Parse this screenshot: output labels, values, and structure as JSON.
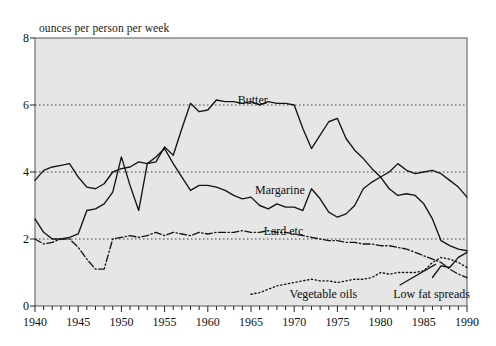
{
  "chart_data": {
    "type": "line",
    "title": "",
    "subtitle": "",
    "ylabel": "ounces per person per week",
    "xlabel": "",
    "xlim": [
      1940,
      1990
    ],
    "ylim": [
      0,
      8
    ],
    "yticks": [
      0,
      2,
      4,
      6,
      8
    ],
    "xticks": [
      1940,
      1945,
      1950,
      1955,
      1960,
      1965,
      1970,
      1975,
      1980,
      1985,
      1990
    ],
    "xtick_minor_step": 1,
    "grid": "horizontal dotted gridlines at 2, 4 and 6",
    "legend": "inline labels placed on the curves",
    "plot_background": "#e6e6e6",
    "line_color": "#141414",
    "x": [
      1940,
      1941,
      1942,
      1943,
      1944,
      1945,
      1946,
      1947,
      1948,
      1949,
      1950,
      1951,
      1952,
      1953,
      1954,
      1955,
      1956,
      1957,
      1958,
      1959,
      1960,
      1961,
      1962,
      1963,
      1964,
      1965,
      1966,
      1967,
      1968,
      1969,
      1970,
      1971,
      1972,
      1973,
      1974,
      1975,
      1976,
      1977,
      1978,
      1979,
      1980,
      1981,
      1982,
      1983,
      1984,
      1985,
      1986,
      1987,
      1988,
      1989,
      1990
    ],
    "series": [
      {
        "name": "Butter",
        "style": "solid",
        "label_x": 1963,
        "label_y": 6.15,
        "values": [
          2.6,
          2.2,
          2.0,
          2.0,
          2.05,
          2.15,
          2.85,
          2.9,
          3.05,
          3.4,
          4.45,
          3.6,
          2.85,
          4.25,
          4.3,
          4.75,
          4.5,
          5.3,
          6.05,
          5.8,
          5.85,
          6.15,
          6.1,
          6.1,
          6.05,
          6.1,
          6.0,
          6.1,
          6.05,
          6.05,
          6.0,
          5.3,
          4.7,
          5.1,
          5.5,
          5.6,
          5.0,
          4.65,
          4.4,
          4.1,
          3.85,
          3.5,
          3.3,
          3.35,
          3.3,
          3.05,
          2.6,
          1.95,
          1.8,
          1.7,
          1.65
        ]
      },
      {
        "name": "Margarine",
        "style": "solid",
        "label_x": 1965,
        "label_y": 3.45,
        "values": [
          3.75,
          4.05,
          4.15,
          4.2,
          4.25,
          3.85,
          3.55,
          3.5,
          3.65,
          4.0,
          4.1,
          4.15,
          4.3,
          4.25,
          4.45,
          4.7,
          4.25,
          3.85,
          3.45,
          3.6,
          3.6,
          3.55,
          3.45,
          3.3,
          3.2,
          3.25,
          3.0,
          2.9,
          3.05,
          2.95,
          2.95,
          2.85,
          3.5,
          3.2,
          2.8,
          2.65,
          2.75,
          3.0,
          3.5,
          3.7,
          3.85,
          4.0,
          4.25,
          4.05,
          3.95,
          4.0,
          4.05,
          3.95,
          3.75,
          3.55,
          3.25
        ]
      },
      {
        "name": "Lard etc",
        "style": "dash-dot",
        "label_x": 1966,
        "label_y": 2.25,
        "values": [
          2.0,
          1.85,
          1.9,
          2.0,
          2.0,
          1.75,
          1.4,
          1.1,
          1.1,
          2.0,
          2.05,
          2.1,
          2.05,
          2.1,
          2.2,
          2.1,
          2.2,
          2.15,
          2.1,
          2.2,
          2.15,
          2.2,
          2.2,
          2.2,
          2.25,
          2.2,
          2.2,
          2.25,
          2.2,
          2.2,
          2.15,
          2.1,
          2.05,
          2.0,
          1.95,
          1.95,
          1.9,
          1.9,
          1.85,
          1.85,
          1.8,
          1.8,
          1.75,
          1.7,
          1.6,
          1.5,
          1.4,
          1.3,
          1.1,
          0.95,
          0.85
        ]
      },
      {
        "name": "Vegetable oils",
        "style": "dotted",
        "label_x": 1969,
        "label_y": 0.35,
        "values": [
          null,
          null,
          null,
          null,
          null,
          null,
          null,
          null,
          null,
          null,
          null,
          null,
          null,
          null,
          null,
          null,
          null,
          null,
          null,
          null,
          null,
          null,
          null,
          null,
          null,
          0.35,
          0.4,
          0.5,
          0.6,
          0.65,
          0.7,
          0.75,
          0.8,
          0.75,
          0.75,
          0.7,
          0.75,
          0.8,
          0.8,
          0.85,
          1.0,
          0.95,
          1.0,
          1.0,
          1.0,
          1.05,
          1.3,
          1.45,
          1.4,
          1.3,
          1.15
        ]
      },
      {
        "name": "Low fat spreads",
        "style": "solid",
        "label_x": 1981,
        "label_y": 0.35,
        "values": [
          null,
          null,
          null,
          null,
          null,
          null,
          null,
          null,
          null,
          null,
          null,
          null,
          null,
          null,
          null,
          null,
          null,
          null,
          null,
          null,
          null,
          null,
          null,
          null,
          null,
          null,
          null,
          null,
          null,
          null,
          null,
          null,
          null,
          null,
          null,
          null,
          null,
          null,
          null,
          null,
          null,
          null,
          null,
          null,
          null,
          null,
          0.85,
          1.2,
          1.15,
          1.45,
          1.6
        ]
      }
    ]
  }
}
